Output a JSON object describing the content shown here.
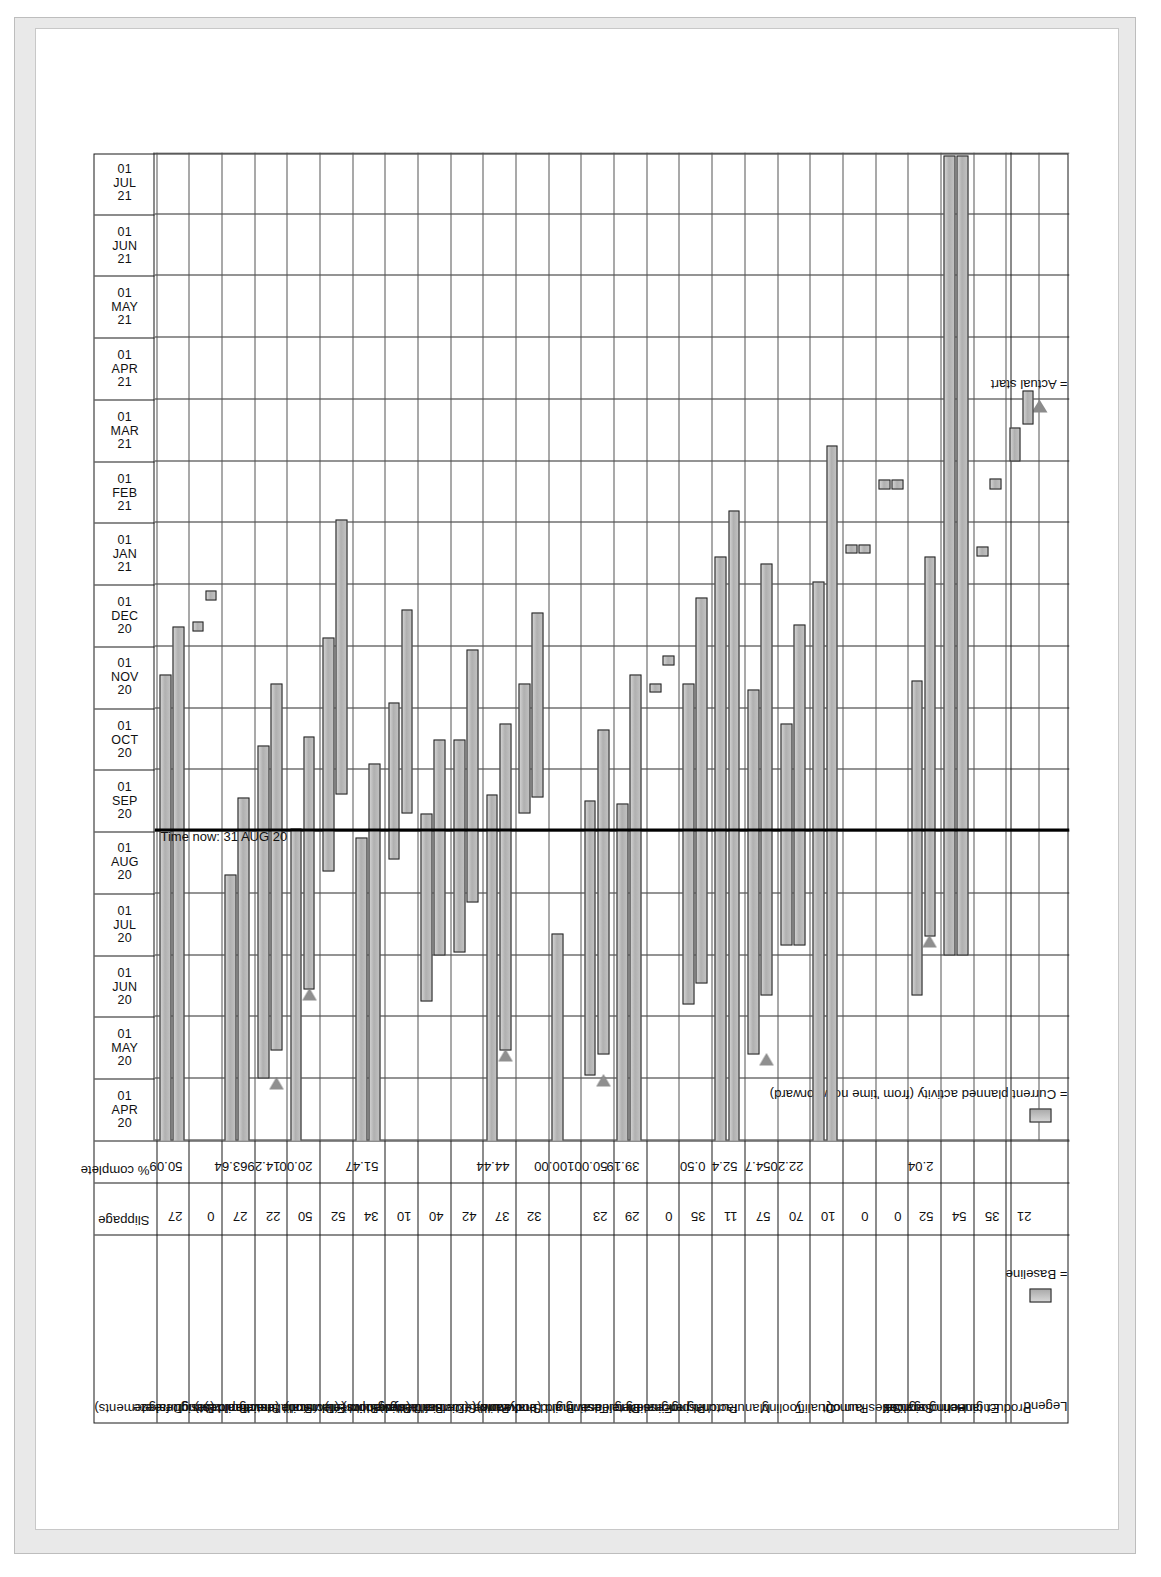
{
  "chart_data": {
    "type": "bar",
    "chart_kind": "gantt",
    "title": "",
    "time_now_label": "Time now: 31 AUG 20",
    "axis_columns": [
      {
        "day": "01",
        "month": "APR",
        "year": "20"
      },
      {
        "day": "01",
        "month": "MAY",
        "year": "20"
      },
      {
        "day": "01",
        "month": "JUN",
        "year": "20"
      },
      {
        "day": "01",
        "month": "JUL",
        "year": "20"
      },
      {
        "day": "01",
        "month": "AUG",
        "year": "20"
      },
      {
        "day": "01",
        "month": "SEP",
        "year": "20"
      },
      {
        "day": "01",
        "month": "OCT",
        "year": "20"
      },
      {
        "day": "01",
        "month": "NOV",
        "year": "20"
      },
      {
        "day": "01",
        "month": "DEC",
        "year": "20"
      },
      {
        "day": "01",
        "month": "JAN",
        "year": "21"
      },
      {
        "day": "01",
        "month": "FEB",
        "year": "21"
      },
      {
        "day": "01",
        "month": "MAR",
        "year": "21"
      },
      {
        "day": "01",
        "month": "APR",
        "year": "21"
      },
      {
        "day": "01",
        "month": "MAY",
        "year": "21"
      },
      {
        "day": "01",
        "month": "JUN",
        "year": "21"
      },
      {
        "day": "01",
        "month": "JUL",
        "year": "21"
      }
    ],
    "columns": [
      "Slippage",
      "% complete"
    ],
    "xlabel": "",
    "ylabel": "",
    "grid": true,
    "rows": [
      {
        "task": "Design",
        "slippage": "27",
        "pct": "50.09",
        "baseline": {
          "start": -0.4,
          "end": 7.55
        },
        "current": {
          "start": -0.4,
          "end": 8.32
        },
        "actual_start": null
      },
      {
        "task": "Design freeze",
        "slippage": "0",
        "pct": "",
        "baseline": {
          "start": 8.25,
          "end": 8.4
        },
        "current": {
          "start": 8.75,
          "end": 8.9
        },
        "actual_start": null
      },
      {
        "task": "Build (structural elements)",
        "slippage": "27",
        "pct": "63.64",
        "baseline": {
          "start": -0.4,
          "end": 4.3
        },
        "current": {
          "start": -0.4,
          "end": 5.55
        },
        "actual_start": null
      },
      {
        "task": "Structural testing",
        "slippage": "22",
        "pct": "14.29",
        "baseline": {
          "start": 1.0,
          "end": 6.4
        },
        "current": {
          "start": 1.45,
          "end": 7.4
        },
        "actual_start": 1.0
      },
      {
        "task": "Build (mechanical)",
        "slippage": "50",
        "pct": "20.00",
        "baseline": {
          "start": -0.4,
          "end": 5.05
        },
        "current": {
          "start": 2.45,
          "end": 6.55
        },
        "actual_start": 2.45
      },
      {
        "task": "Endurance testing",
        "slippage": "52",
        "pct": "",
        "baseline": {
          "start": 4.35,
          "end": 8.15
        },
        "current": {
          "start": 5.6,
          "end": 10.05
        },
        "actual_start": null
      },
      {
        "task": "Build (electrical)",
        "slippage": "34",
        "pct": "51.47",
        "baseline": {
          "start": -0.4,
          "end": 4.9
        },
        "current": {
          "start": -0.4,
          "end": 6.1
        },
        "actual_start": null
      },
      {
        "task": "Shakedown (Divisional development)",
        "slippage": "10",
        "pct": "",
        "baseline": {
          "start": 4.55,
          "end": 7.1
        },
        "current": {
          "start": 5.3,
          "end": 8.6
        },
        "actual_start": null
      },
      {
        "task": "Build (hydraulics)",
        "slippage": "40",
        "pct": "",
        "baseline": {
          "start": 2.25,
          "end": 5.3
        },
        "current": {
          "start": 3.0,
          "end": 6.5
        },
        "actual_start": null
      },
      {
        "task": "Structural testing",
        "slippage": "42",
        "pct": "",
        "baseline": {
          "start": 3.05,
          "end": 6.5
        },
        "current": {
          "start": 3.85,
          "end": 7.95
        },
        "actual_start": null
      },
      {
        "task": "Build (external fittings)",
        "slippage": "37",
        "pct": "44.44",
        "baseline": {
          "start": -0.4,
          "end": 5.6
        },
        "current": {
          "start": 1.45,
          "end": 6.75
        },
        "actual_start": 1.45
      },
      {
        "task": "Shakedown (Divisional development)",
        "slippage": "32",
        "pct": "",
        "baseline": {
          "start": 5.3,
          "end": 7.4
        },
        "current": {
          "start": 5.55,
          "end": 8.55
        },
        "actual_start": null
      },
      {
        "task": "Build (bodywork)",
        "slippage": "",
        "pct": "100.00",
        "baseline": {
          "start": -0.4,
          "end": 3.35
        },
        "current": null,
        "actual_start": -0.4
      },
      {
        "task": "Testing and endurance",
        "slippage": "23",
        "pct": "50.00",
        "baseline": {
          "start": 1.05,
          "end": 5.5
        },
        "current": {
          "start": 1.4,
          "end": 6.65
        },
        "actual_start": 1.05
      },
      {
        "task": "Detail drawing",
        "slippage": "29",
        "pct": "39.19",
        "baseline": {
          "start": -0.4,
          "end": 5.45
        },
        "current": {
          "start": -0.4,
          "end": 7.55
        },
        "actual_start": null
      },
      {
        "task": "Final PI release",
        "slippage": "0",
        "pct": "",
        "baseline": {
          "start": 7.25,
          "end": 7.4
        },
        "current": {
          "start": 7.7,
          "end": 7.85
        },
        "actual_start": null
      },
      {
        "task": "PI processing",
        "slippage": "35",
        "pct": "0.50",
        "baseline": {
          "start": 2.2,
          "end": 7.4
        },
        "current": {
          "start": 2.55,
          "end": 8.8
        },
        "actual_start": null
      },
      {
        "task": "Purchasing",
        "slippage": "11",
        "pct": "52.4",
        "baseline": {
          "start": -0.4,
          "end": 9.45
        },
        "current": {
          "start": -0.4,
          "end": 10.2
        },
        "actual_start": null
      },
      {
        "task": "Manufacturing engineering",
        "slippage": "57",
        "pct": "54.7",
        "baseline": {
          "start": 1.4,
          "end": 7.3
        },
        "current": {
          "start": 2.35,
          "end": 9.35
        },
        "actual_start": 1.4
      },
      {
        "task": "Tooling",
        "slippage": "70",
        "pct": "22.20",
        "baseline": {
          "start": 3.15,
          "end": 6.75
        },
        "current": {
          "start": 3.15,
          "end": 8.35
        },
        "actual_start": null
      },
      {
        "task": "Quality",
        "slippage": "10",
        "pct": "",
        "baseline": {
          "start": -0.4,
          "end": 9.05
        },
        "current": {
          "start": -0.4,
          "end": 11.25
        },
        "actual_start": null
      },
      {
        "task": "Run out",
        "slippage": "0",
        "pct": "",
        "baseline": {
          "start": 9.5,
          "end": 9.65
        },
        "current": {
          "start": 9.5,
          "end": 9.65
        },
        "actual_start": null
      },
      {
        "task": "Sales launch",
        "slippage": "0",
        "pct": "",
        "baseline": {
          "start": 10.55,
          "end": 10.7
        },
        "current": {
          "start": 10.55,
          "end": 10.7
        },
        "actual_start": null
      },
      {
        "task": "Services",
        "slippage": "52",
        "pct": "2.04",
        "baseline": {
          "start": 2.35,
          "end": 7.45
        },
        "current": {
          "start": 3.3,
          "end": 9.45
        },
        "actual_start": 3.3
      },
      {
        "task": "Homologation",
        "slippage": "54",
        "pct": "",
        "baseline": {
          "start": 3.0,
          "end": 15.95
        },
        "current": {
          "start": 3.0,
          "end": 15.95
        },
        "actual_start": null
      },
      {
        "task": "Engineering sign off",
        "slippage": "35",
        "pct": "",
        "baseline": {
          "start": 9.45,
          "end": 9.62
        },
        "current": {
          "start": 10.55,
          "end": 10.72
        },
        "actual_start": null
      },
      {
        "task": "Product launch",
        "slippage": "21",
        "pct": "",
        "baseline": {
          "start": 11.0,
          "end": 11.55
        },
        "current": {
          "start": 11.6,
          "end": 12.15
        },
        "actual_start": null
      }
    ]
  },
  "legend": {
    "title": "Legend",
    "items": [
      {
        "symbol": "baseline-swatch",
        "text": "= Baseline"
      },
      {
        "symbol": "current-swatch",
        "text": "= Current planned activity (from 'time now' forward)"
      },
      {
        "symbol": "actual-start-triangle",
        "text": "= Actual start"
      }
    ]
  }
}
